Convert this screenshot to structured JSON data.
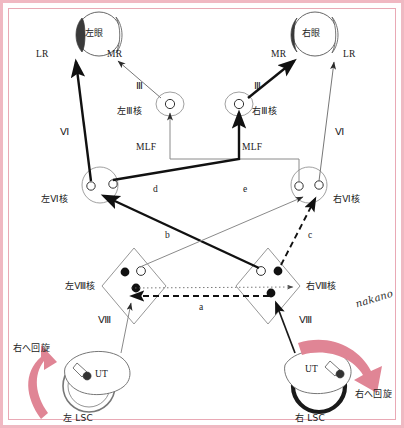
{
  "figure": {
    "signature": "nakano",
    "border_color": "#f0b8c2",
    "arrow_color": "#e08595"
  },
  "eyes": {
    "left": {
      "label": "左眼",
      "lateral_rectus": "LR",
      "medial_rectus": "MR"
    },
    "right": {
      "label": "右眼",
      "lateral_rectus": "LR",
      "medial_rectus": "MR"
    }
  },
  "nuclei": {
    "oculomotor_left": {
      "label": "左Ⅲ核",
      "nerve": "Ⅲ"
    },
    "oculomotor_right": {
      "label": "右Ⅲ核",
      "nerve": "Ⅲ"
    },
    "abducens_left": {
      "label": "左Ⅵ核",
      "nerve": "Ⅵ"
    },
    "abducens_right": {
      "label": "右Ⅵ核",
      "nerve": "Ⅵ"
    },
    "vestibular_left": {
      "label": "左Ⅷ核",
      "nerve": "Ⅷ"
    },
    "vestibular_right": {
      "label": "右Ⅷ核",
      "nerve": "Ⅷ"
    }
  },
  "tracts": {
    "mlf_left": "MLF",
    "mlf_right": "MLF",
    "a": "a",
    "b": "b",
    "c": "c",
    "d": "d",
    "e": "e"
  },
  "labyrinth": {
    "left": {
      "canal": "左 LSC",
      "utricle": "UT",
      "rotation": "右へ回旋"
    },
    "right": {
      "canal": "右 LSC",
      "utricle": "UT",
      "rotation": "右へ回旋"
    }
  }
}
